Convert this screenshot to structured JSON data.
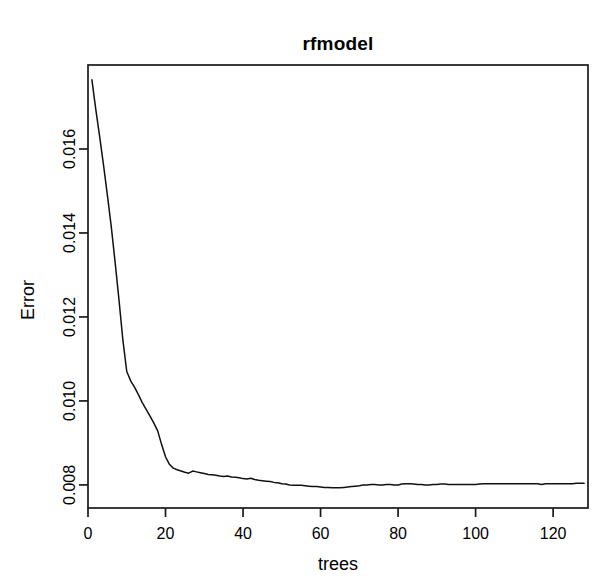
{
  "chart_data": {
    "type": "line",
    "title": "rfmodel",
    "xlabel": "trees",
    "ylabel": "Error",
    "xlim": [
      0,
      129
    ],
    "ylim": [
      0.00745,
      0.018
    ],
    "grid": false,
    "legend": "none",
    "xticks": [
      0,
      20,
      40,
      60,
      80,
      100,
      120
    ],
    "xtick_labels": [
      "0",
      "20",
      "40",
      "60",
      "80",
      "100",
      "120"
    ],
    "yticks": [
      0.008,
      0.01,
      0.012,
      0.014,
      0.016
    ],
    "ytick_labels": [
      "0.008",
      "0.010",
      "0.012",
      "0.014",
      "0.016"
    ],
    "series": [
      {
        "name": "OOB Error",
        "color": "#111111",
        "x": [
          1,
          2,
          3,
          4,
          5,
          6,
          7,
          8,
          9,
          10,
          11,
          12,
          13,
          14,
          15,
          16,
          17,
          18,
          19,
          20,
          21,
          22,
          23,
          24,
          25,
          26,
          27,
          28,
          29,
          30,
          31,
          32,
          33,
          34,
          35,
          36,
          37,
          38,
          39,
          40,
          41,
          42,
          43,
          44,
          45,
          46,
          47,
          48,
          49,
          50,
          51,
          52,
          53,
          54,
          55,
          56,
          57,
          58,
          59,
          60,
          61,
          62,
          63,
          64,
          65,
          66,
          67,
          68,
          69,
          70,
          71,
          72,
          73,
          74,
          75,
          76,
          77,
          78,
          79,
          80,
          81,
          82,
          83,
          84,
          85,
          86,
          87,
          88,
          89,
          90,
          91,
          92,
          93,
          94,
          95,
          96,
          97,
          98,
          99,
          100,
          101,
          102,
          103,
          104,
          105,
          106,
          107,
          108,
          109,
          110,
          111,
          112,
          113,
          114,
          115,
          116,
          117,
          118,
          119,
          120,
          121,
          122,
          123,
          124,
          125,
          126,
          127,
          128
        ],
        "y": [
          0.01765,
          0.01695,
          0.0163,
          0.01562,
          0.0149,
          0.01415,
          0.0133,
          0.0124,
          0.01145,
          0.0107,
          0.01048,
          0.01033,
          0.01015,
          0.00996,
          0.0098,
          0.00964,
          0.00947,
          0.00928,
          0.00896,
          0.00867,
          0.00849,
          0.0084,
          0.00836,
          0.00833,
          0.0083,
          0.00828,
          0.00833,
          0.00831,
          0.00829,
          0.00827,
          0.00825,
          0.00824,
          0.00823,
          0.00821,
          0.0082,
          0.00821,
          0.00819,
          0.00818,
          0.00817,
          0.00815,
          0.00814,
          0.00816,
          0.00813,
          0.00811,
          0.0081,
          0.00809,
          0.00808,
          0.00806,
          0.00805,
          0.00803,
          0.00802,
          0.008,
          0.00799,
          0.00799,
          0.00799,
          0.00798,
          0.00797,
          0.00796,
          0.00796,
          0.00795,
          0.00794,
          0.00794,
          0.00793,
          0.00793,
          0.00793,
          0.00794,
          0.00795,
          0.00796,
          0.00797,
          0.00798,
          0.008,
          0.008,
          0.00801,
          0.00801,
          0.008,
          0.008,
          0.00801,
          0.00801,
          0.008,
          0.008,
          0.00802,
          0.00803,
          0.00803,
          0.00802,
          0.00801,
          0.00801,
          0.008,
          0.008,
          0.00801,
          0.00801,
          0.00802,
          0.00802,
          0.00801,
          0.00801,
          0.00801,
          0.00801,
          0.00801,
          0.00801,
          0.00801,
          0.00801,
          0.00802,
          0.00803,
          0.00803,
          0.00803,
          0.00803,
          0.00803,
          0.00803,
          0.00803,
          0.00803,
          0.00803,
          0.00803,
          0.00803,
          0.00803,
          0.00803,
          0.00803,
          0.00803,
          0.00801,
          0.00803,
          0.00803,
          0.00803,
          0.00803,
          0.00803,
          0.00803,
          0.00803,
          0.00803,
          0.00804,
          0.00804,
          0.00804
        ]
      }
    ]
  },
  "geometry": {
    "plot_left": 88,
    "plot_right": 588,
    "plot_top": 65,
    "plot_bottom": 508
  },
  "colors": {
    "background": "#ffffff",
    "axis": "#1a1a1a",
    "series": "#111111"
  }
}
